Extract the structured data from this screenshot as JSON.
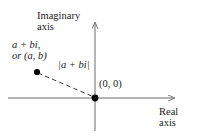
{
  "figure": {
    "width": 198,
    "height": 139,
    "background": "#ffffff",
    "line_color": "#6b6b6b",
    "text_color": "#1a1a1a",
    "dot_color": "#000000"
  },
  "axes": {
    "vertical": {
      "label_line1": "Imaginary",
      "label_line2": "axis",
      "x": 95,
      "y_top": 19,
      "y_bottom": 131
    },
    "horizontal": {
      "label_line1": "Real",
      "label_line2": "axis",
      "y": 98,
      "x_left": 8,
      "x_right": 178
    }
  },
  "points": {
    "complex": {
      "label_line1": "a + bi,",
      "label_line2": "or (a, b)",
      "x": 37,
      "y": 72
    },
    "origin": {
      "label": "(0, 0)",
      "x": 95,
      "y": 98
    }
  },
  "segment": {
    "label": "|a + bi|",
    "style": "dashed"
  }
}
